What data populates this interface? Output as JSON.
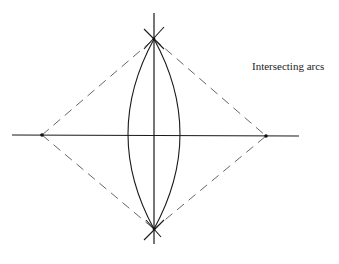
{
  "diagram": {
    "label": "Intersecting arcs",
    "colors": {
      "line": "#1a1a1a",
      "dashed": "#555555",
      "background": "#ffffff"
    },
    "points": {
      "left": [
        42,
        135
      ],
      "right": [
        266,
        136
      ],
      "top": [
        154,
        39
      ],
      "bottom": [
        154,
        229
      ]
    }
  }
}
